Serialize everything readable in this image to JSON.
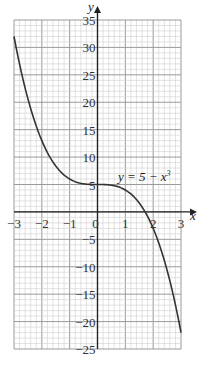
{
  "chart_data": {
    "type": "line",
    "title": "",
    "function_label": "y = 5 − x³",
    "xlabel": "x",
    "ylabel": "y",
    "xlim": [
      -3,
      3
    ],
    "ylim": [
      -25,
      35
    ],
    "grid": true,
    "x_ticks": [
      -3,
      -2,
      -1,
      0,
      1,
      2,
      3
    ],
    "x_tick_labels": [
      "−3",
      "−2",
      "−1",
      "0",
      "1",
      "2",
      "3"
    ],
    "y_ticks": [
      35,
      30,
      25,
      20,
      15,
      10,
      5,
      -5,
      -10,
      -15,
      -20,
      -25
    ],
    "y_tick_labels": [
      "35",
      "30",
      "25",
      "20",
      "15",
      "10",
      "5",
      "−5",
      "−10",
      "−15",
      "−20",
      "−25"
    ],
    "series": [
      {
        "name": "y = 5 − x³",
        "x": [
          -3,
          -2.5,
          -2,
          -1.5,
          -1,
          -0.5,
          0,
          0.5,
          1,
          1.5,
          2,
          2.5,
          3
        ],
        "values": [
          32,
          20.625,
          13,
          8.375,
          6,
          5.125,
          5,
          4.875,
          4,
          1.625,
          -3,
          -10.625,
          -22
        ]
      }
    ]
  },
  "labels": {
    "x_axis": "x",
    "y_axis": "y",
    "curve": "y = 5 − x",
    "curve_exp": "3",
    "origin": "0"
  }
}
